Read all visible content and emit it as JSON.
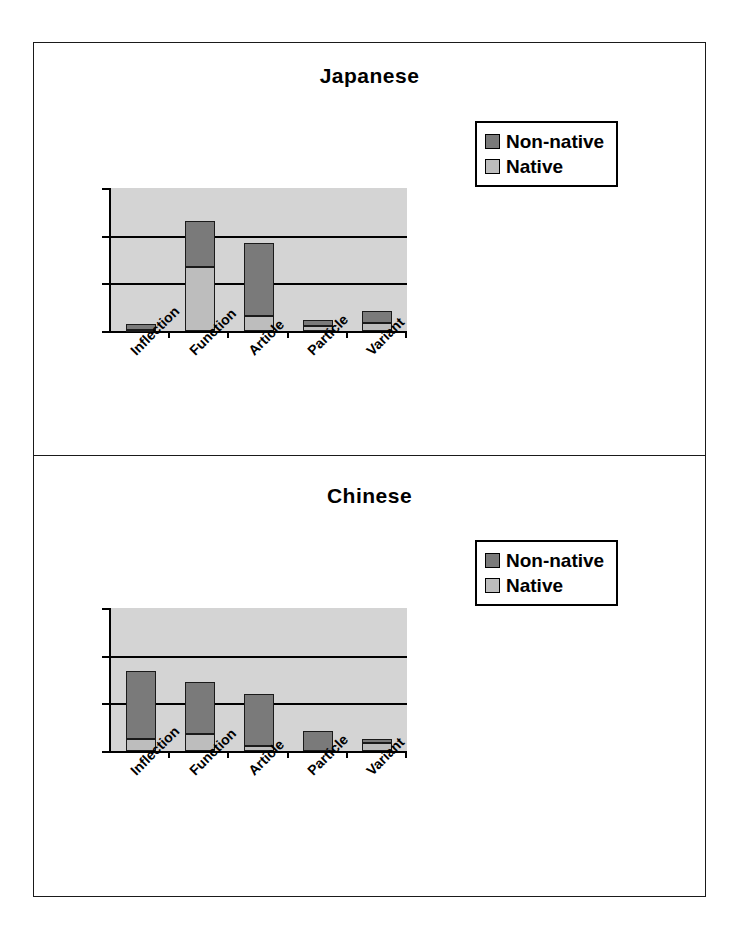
{
  "figure": {
    "background": "#ffffff",
    "frame_color": "#1a1a1a"
  },
  "legend": {
    "entries": [
      {
        "label": "Non-native",
        "color": "#7a7a7a",
        "key": "non_native"
      },
      {
        "label": "Native",
        "color": "#bdbdbd",
        "key": "native"
      }
    ]
  },
  "axis": {
    "y_ticks": [
      "0",
      "20",
      "40",
      "60"
    ],
    "y_min": 0,
    "y_max": 60
  },
  "chart_data": [
    {
      "type": "bar",
      "subtype": "stacked",
      "title": "Japanese",
      "xlabel": "",
      "ylabel": "",
      "ylim": [
        0,
        60
      ],
      "yticks": [
        0,
        20,
        40,
        60
      ],
      "grid": true,
      "legend_position": "top-right",
      "categories": [
        "Inflection",
        "Function",
        "Article",
        "Particle",
        "Variant"
      ],
      "series": [
        {
          "name": "Native",
          "color": "#bdbdbd",
          "values": [
            0.5,
            27,
            6.5,
            2,
            3.5
          ]
        },
        {
          "name": "Non-native",
          "color": "#7a7a7a",
          "values": [
            2.5,
            19,
            30.5,
            2.5,
            5
          ]
        }
      ],
      "totals": [
        3,
        46,
        37,
        4.5,
        8.5
      ]
    },
    {
      "type": "bar",
      "subtype": "stacked",
      "title": "Chinese",
      "xlabel": "",
      "ylabel": "",
      "ylim": [
        0,
        60
      ],
      "yticks": [
        0,
        20,
        40,
        60
      ],
      "grid": true,
      "legend_position": "top-right",
      "categories": [
        "Inflection",
        "Function",
        "Article",
        "Particle",
        "Variant"
      ],
      "series": [
        {
          "name": "Native",
          "color": "#bdbdbd",
          "values": [
            5,
            7,
            2,
            0,
            3.5
          ]
        },
        {
          "name": "Non-native",
          "color": "#7a7a7a",
          "values": [
            28.5,
            22,
            22,
            8.5,
            1.5
          ]
        }
      ],
      "totals": [
        33.5,
        29,
        24,
        8.5,
        5
      ]
    }
  ]
}
